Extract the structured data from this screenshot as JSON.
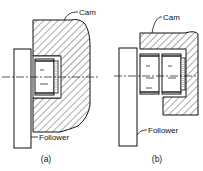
{
  "diagram": {
    "panels": [
      {
        "id": "a",
        "caption": "(a)",
        "labels": {
          "cam": "Cam",
          "follower": "Follower"
        },
        "roller_count": 1
      },
      {
        "id": "b",
        "caption": "(b)",
        "labels": {
          "cam": "Cam",
          "follower": "Follower"
        },
        "roller_count": 2
      }
    ],
    "colors": {
      "line": "#111111",
      "background": "#ffffff"
    }
  }
}
